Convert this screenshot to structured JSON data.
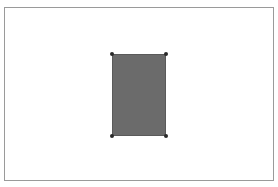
{
  "canvas": {
    "background_color": "#ffffff",
    "border_color": "#9a9a9a"
  },
  "shape": {
    "type": "rectangle",
    "fill_color": "#6b6b6b",
    "stroke_color": "#5a5a5a",
    "selected": true,
    "handle_color": "#2a2a2a",
    "handles": [
      "top-left",
      "top-right",
      "bottom-left",
      "bottom-right"
    ]
  }
}
